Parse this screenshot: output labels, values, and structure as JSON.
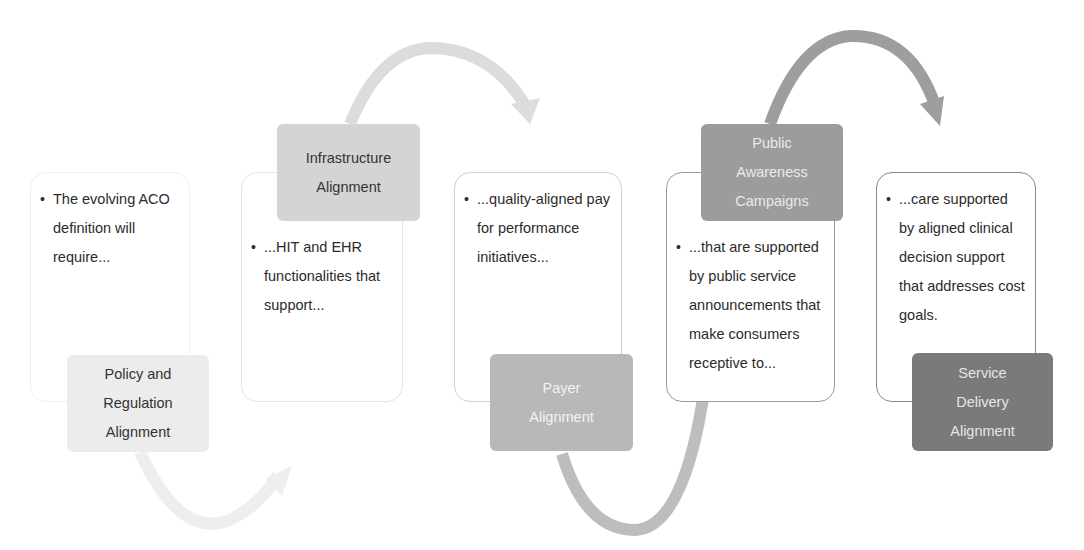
{
  "diagram": {
    "type": "process-flow",
    "colors": {
      "stage1": "#ececec",
      "stage2": "#d4d4d4",
      "stage3": "#b8b8b8",
      "stage4": "#9c9c9c",
      "stage5": "#7a7a7a",
      "text_box_border_light": "#eeeeee",
      "text_box_border_dark": "#8a8a8a"
    },
    "stages": [
      {
        "label_lines": [
          "Policy and",
          "Regulation",
          "Alignment"
        ],
        "bullet": "•",
        "text": "The evolving ACO definition will require..."
      },
      {
        "label_lines": [
          "Infrastructure",
          "Alignment"
        ],
        "bullet": "•",
        "text": "...HIT and EHR functionalities that support..."
      },
      {
        "label_lines": [
          "Payer",
          "Alignment"
        ],
        "bullet": "•",
        "text": "...quality-aligned pay for performance initiatives..."
      },
      {
        "label_lines": [
          "Public",
          "Awareness",
          "Campaigns"
        ],
        "bullet": "•",
        "text": "...that are supported by public service announcements that make consumers receptive to..."
      },
      {
        "label_lines": [
          "Service",
          "Delivery",
          "Alignment"
        ],
        "bullet": "•",
        "text": "...care supported by aligned clinical decision support that addresses cost goals."
      }
    ],
    "arrows": [
      {
        "from": "Policy and Regulation Alignment",
        "to": "Infrastructure Alignment",
        "direction": "below-curve"
      },
      {
        "from": "Infrastructure Alignment",
        "to": "Payer Alignment",
        "direction": "above-curve"
      },
      {
        "from": "Payer Alignment",
        "to": "Public Awareness Campaigns",
        "direction": "below-curve"
      },
      {
        "from": "Public Awareness Campaigns",
        "to": "Service Delivery Alignment",
        "direction": "above-curve"
      }
    ]
  }
}
